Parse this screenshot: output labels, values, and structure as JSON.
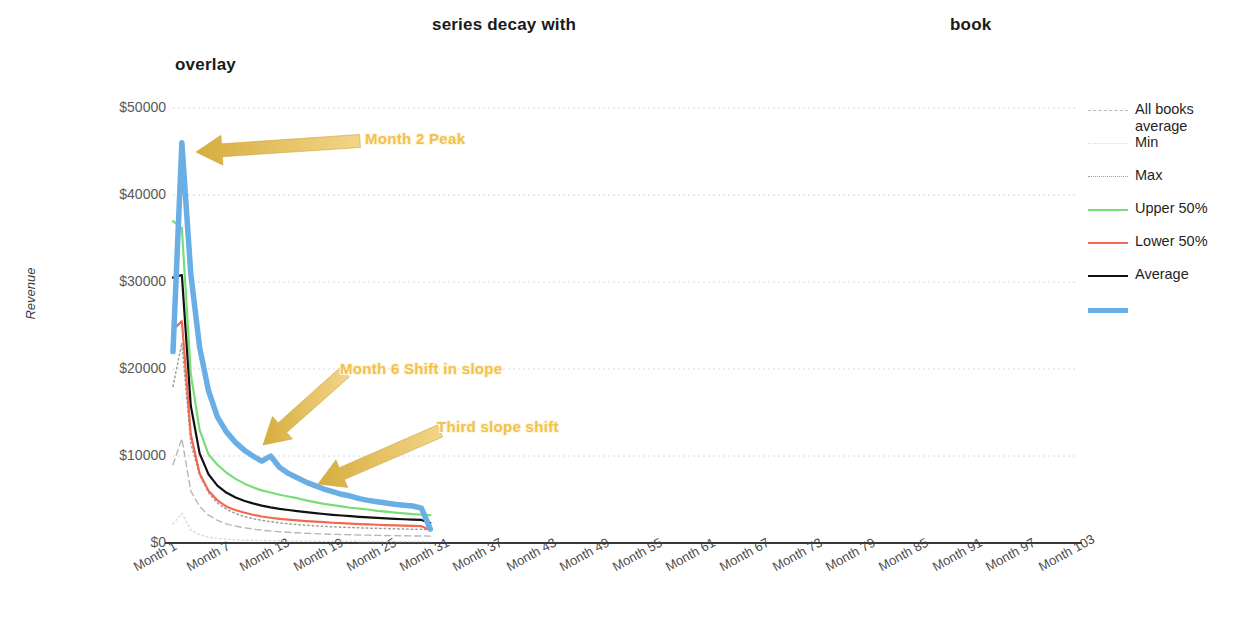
{
  "title": {
    "fragment_1": "series decay with",
    "fragment_2": "book",
    "fragment_3": "overlay"
  },
  "axes": {
    "y_title": "Revenue",
    "y_ticks": [
      "$50000",
      "$40000",
      "$30000",
      "$20000",
      "$10000",
      "$0"
    ],
    "x_ticks": [
      "Month 1",
      "Month 7",
      "Month 13",
      "Month 19",
      "Month 25",
      "Month 31",
      "Month 37",
      "Month 43",
      "Month 49",
      "Month 55",
      "Month 61",
      "Month 67",
      "Month 73",
      "Month 79",
      "Month 85",
      "Month 91",
      "Month 97",
      "Month 103"
    ]
  },
  "legend": {
    "items": [
      {
        "label": "All books average",
        "color": "#b7b7b7",
        "style": "dashed",
        "width": 1.4
      },
      {
        "label": "Min",
        "color": "#dcdcdc",
        "style": "dotted",
        "width": 1.3
      },
      {
        "label": "Max",
        "color": "#9e9e9e",
        "style": "dotted",
        "width": 1.6
      },
      {
        "label": "Upper 50%",
        "color": "#77dd77",
        "style": "solid",
        "width": 2.2
      },
      {
        "label": "Lower 50%",
        "color": "#f4684f",
        "style": "solid",
        "width": 2.2
      },
      {
        "label": "Average",
        "color": "#111111",
        "style": "solid",
        "width": 2.6
      },
      {
        "label": "",
        "color": "#6aaee6",
        "style": "solid",
        "width": 5.5
      }
    ]
  },
  "annotations": [
    {
      "text": "Month 2 Peak",
      "arrow_color": "#e8c25c"
    },
    {
      "text": "Month 6 Shift in slope",
      "arrow_color": "#e8c25c"
    },
    {
      "text": "Third slope shift",
      "arrow_color": "#e8c25c"
    }
  ],
  "chart_data": {
    "type": "line",
    "title": "series decay with book overlay",
    "xlabel": "",
    "ylabel": "Revenue",
    "ylim": [
      0,
      50000
    ],
    "grid": true,
    "legend_position": "right",
    "x": [
      1,
      2,
      3,
      4,
      5,
      6,
      7,
      8,
      9,
      10,
      11,
      12,
      13,
      14,
      15,
      16,
      17,
      18,
      19,
      20,
      21,
      22,
      23,
      24,
      25,
      26,
      27,
      28,
      29,
      30
    ],
    "x_tick_values": [
      1,
      7,
      13,
      19,
      25,
      31,
      37,
      43,
      49,
      55,
      61,
      67,
      73,
      79,
      85,
      91,
      97,
      103
    ],
    "x_axis_max_month": 103,
    "series": [
      {
        "name": "All books average",
        "color": "#b7b7b7",
        "style": "dashed",
        "values": [
          9000,
          12000,
          6000,
          4200,
          3200,
          2600,
          2200,
          1950,
          1750,
          1600,
          1480,
          1380,
          1300,
          1230,
          1170,
          1120,
          1080,
          1040,
          1000,
          970,
          945,
          920,
          900,
          880,
          862,
          845,
          830,
          815,
          802,
          790
        ]
      },
      {
        "name": "Min",
        "color": "#dcdcdc",
        "style": "dotted",
        "values": [
          2200,
          3400,
          1500,
          950,
          680,
          520,
          430,
          370,
          330,
          300,
          280,
          262,
          248,
          236,
          226,
          218,
          211,
          205,
          199,
          194,
          190,
          186,
          182,
          179,
          176,
          173,
          170,
          168,
          166,
          164
        ]
      },
      {
        "name": "Max",
        "color": "#9e9e9e",
        "style": "dotted",
        "values": [
          18000,
          23000,
          11500,
          7800,
          5800,
          4600,
          3900,
          3400,
          3050,
          2800,
          2600,
          2450,
          2320,
          2210,
          2120,
          2040,
          1975,
          1915,
          1865,
          1820,
          1780,
          1745,
          1712,
          1683,
          1657,
          1632,
          1610,
          1590,
          1572,
          1555
        ]
      },
      {
        "name": "Upper 50%",
        "color": "#77dd77",
        "style": "solid",
        "values": [
          37000,
          36200,
          19500,
          13000,
          10200,
          9000,
          8100,
          7400,
          6850,
          6400,
          6050,
          5800,
          5550,
          5350,
          5150,
          4900,
          4700,
          4500,
          4350,
          4200,
          4050,
          3950,
          3850,
          3700,
          3600,
          3500,
          3400,
          3320,
          3250,
          3200
        ]
      },
      {
        "name": "Lower 50%",
        "color": "#f4684f",
        "style": "solid",
        "values": [
          24500,
          25500,
          12500,
          8000,
          6000,
          4900,
          4200,
          3800,
          3500,
          3250,
          3050,
          2900,
          2780,
          2680,
          2600,
          2520,
          2450,
          2390,
          2330,
          2280,
          2230,
          2180,
          2140,
          2100,
          2060,
          2020,
          1990,
          1960,
          1930,
          1500
        ]
      },
      {
        "name": "Average",
        "color": "#111111",
        "style": "solid",
        "values": [
          30500,
          30800,
          15800,
          10300,
          7900,
          6600,
          5800,
          5250,
          4850,
          4550,
          4300,
          4100,
          3930,
          3790,
          3660,
          3540,
          3430,
          3330,
          3240,
          3160,
          3080,
          3010,
          2950,
          2890,
          2830,
          2780,
          2730,
          2690,
          2650,
          2300
        ]
      },
      {
        "name": "",
        "color": "#6aaee6",
        "style": "solid",
        "width": 5.5,
        "values": [
          22000,
          46000,
          31000,
          22500,
          17500,
          14500,
          12800,
          11600,
          10700,
          10000,
          9400,
          10000,
          8700,
          8000,
          7500,
          7000,
          6600,
          6200,
          5900,
          5600,
          5400,
          5100,
          4900,
          4750,
          4600,
          4450,
          4350,
          4250,
          4000,
          1600
        ]
      }
    ],
    "annotations": [
      {
        "text": "Month 2 Peak",
        "points_to_month": 2,
        "points_to_value": 46000
      },
      {
        "text": "Month 6 Shift in slope",
        "points_to_month": 6,
        "points_to_value": 14500
      },
      {
        "text": "Third slope shift",
        "points_to_month": 11,
        "points_to_value": 9400
      }
    ]
  }
}
